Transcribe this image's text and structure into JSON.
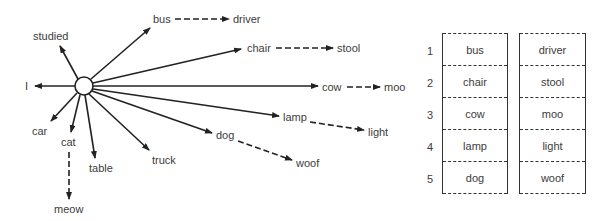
{
  "diagram": {
    "hub": {
      "cx": 84,
      "cy": 86,
      "r": 9
    },
    "associations": [
      {
        "word": "studied",
        "x": 33,
        "y": 30
      },
      {
        "word": "bus",
        "x": 153,
        "y": 13
      },
      {
        "word": "chair",
        "x": 247,
        "y": 42
      },
      {
        "word": "I",
        "x": 25,
        "y": 80
      },
      {
        "word": "cow",
        "x": 322,
        "y": 82
      },
      {
        "word": "lamp",
        "x": 283,
        "y": 112
      },
      {
        "word": "dog",
        "x": 216,
        "y": 129
      },
      {
        "word": "car",
        "x": 32,
        "y": 125
      },
      {
        "word": "cat",
        "x": 61,
        "y": 136
      },
      {
        "word": "table",
        "x": 89,
        "y": 162
      },
      {
        "word": "truck",
        "x": 152,
        "y": 154
      },
      {
        "word": "driver",
        "x": 233,
        "y": 13
      },
      {
        "word": "stool",
        "x": 337,
        "y": 42
      },
      {
        "word": "moo",
        "x": 384,
        "y": 82
      },
      {
        "word": "light",
        "x": 368,
        "y": 126
      },
      {
        "word": "woof",
        "x": 296,
        "y": 157
      },
      {
        "word": "meow",
        "x": 54,
        "y": 203
      }
    ],
    "pairs": [
      {
        "from": "bus",
        "to": "driver"
      },
      {
        "from": "chair",
        "to": "stool"
      },
      {
        "from": "cow",
        "to": "moo"
      },
      {
        "from": "lamp",
        "to": "light"
      },
      {
        "from": "dog",
        "to": "woof"
      },
      {
        "from": "cat",
        "to": "meow"
      }
    ]
  },
  "table": {
    "rows": [
      {
        "num": "1",
        "stimulus": "bus",
        "response": "driver"
      },
      {
        "num": "2",
        "stimulus": "chair",
        "response": "stool"
      },
      {
        "num": "3",
        "stimulus": "cow",
        "response": "moo"
      },
      {
        "num": "4",
        "stimulus": "lamp",
        "response": "light"
      },
      {
        "num": "5",
        "stimulus": "dog",
        "response": "woof"
      }
    ]
  }
}
